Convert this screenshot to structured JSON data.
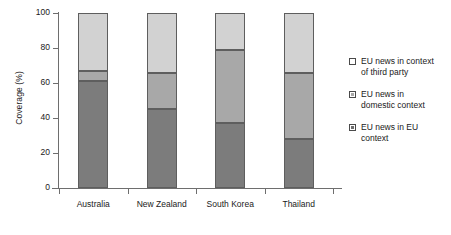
{
  "chart_data": {
    "type": "bar",
    "subtype": "stacked-vertical",
    "title": "",
    "xlabel": "",
    "ylabel": "Coverage (%)",
    "ylim": [
      0,
      100
    ],
    "yticks": [
      0,
      20,
      40,
      60,
      80,
      100
    ],
    "ytick_labels": [
      "0",
      "20",
      "40",
      "60",
      "80",
      "100"
    ],
    "grid": false,
    "legend_position": "right",
    "categories": [
      "Australia",
      "New Zealand",
      "South Korea",
      "Thailand"
    ],
    "series": [
      {
        "name": "EU news in EU context",
        "color": "#7c7c7c",
        "values": [
          61,
          45,
          37,
          28
        ]
      },
      {
        "name": "EU news in domestic context",
        "color": "#a8a8a8",
        "values": [
          6,
          21,
          42,
          38
        ]
      },
      {
        "name": "EU news in context of third party",
        "color": "#d2d2d2",
        "values": [
          33,
          34,
          21,
          34
        ]
      }
    ],
    "cumulative_tops": {
      "Australia": [
        61,
        67,
        100
      ],
      "New Zealand": [
        45,
        66,
        100
      ],
      "South Korea": [
        37,
        79,
        100
      ],
      "Thailand": [
        28,
        66,
        100
      ]
    }
  },
  "legend": {
    "items": [
      {
        "line1": "EU news in context",
        "line2": "of third party",
        "swatch": "third"
      },
      {
        "line1": "EU news in",
        "line2": "domestic context",
        "swatch": "dom"
      },
      {
        "line1": "EU news in EU",
        "line2": "context",
        "swatch": "eu"
      }
    ]
  }
}
